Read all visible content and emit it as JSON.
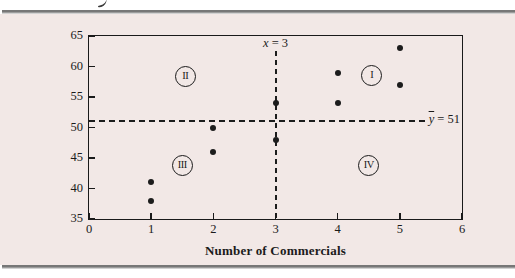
{
  "figure": {
    "background_color": "#f2e8e6",
    "rule_color": "#8a8a8a",
    "frame_color": "#1a1a1a"
  },
  "chart_data": {
    "type": "scatter",
    "title": "",
    "xlabel": "Number of Commercials",
    "ylabel": "Sales ($100s)",
    "xlim": [
      0,
      6
    ],
    "ylim": [
      35,
      65
    ],
    "xticks": [
      "0",
      "1",
      "2",
      "3",
      "4",
      "5",
      "6"
    ],
    "yticks": [
      "35",
      "40",
      "45",
      "50",
      "55",
      "60",
      "65"
    ],
    "grid": false,
    "legend": null,
    "points": [
      [
        1,
        38
      ],
      [
        1,
        41
      ],
      [
        2,
        46
      ],
      [
        2,
        50
      ],
      [
        3,
        48
      ],
      [
        3,
        54
      ],
      [
        4,
        54
      ],
      [
        4,
        59
      ],
      [
        5,
        57
      ],
      [
        5,
        63
      ]
    ],
    "point_color": "#1c1c1c",
    "mean_x": 3,
    "mean_y": 51,
    "mean_x_label": {
      "symbol": "x",
      "rest": " = 3"
    },
    "mean_y_label": {
      "symbol": "y",
      "rest": " = 51"
    },
    "quadrant_labels": [
      {
        "label": "I",
        "x": 4.55,
        "y": 58.5
      },
      {
        "label": "II",
        "x": 1.55,
        "y": 58.3
      },
      {
        "label": "III",
        "x": 1.5,
        "y": 43.7
      },
      {
        "label": "IV",
        "x": 4.5,
        "y": 43.8
      }
    ]
  }
}
